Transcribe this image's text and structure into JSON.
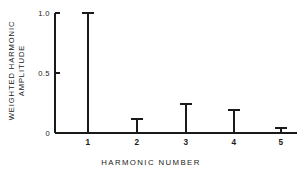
{
  "chart_data": {
    "type": "bar",
    "title": "",
    "xlabel": "HARMONIC NUMBER",
    "ylabel_lines": [
      "WEIGHTED  HARMONIC",
      "AMPLITUDE"
    ],
    "ylabel": "WEIGHTED HARMONIC AMPLITUDE",
    "categories": [
      "1",
      "2",
      "3",
      "4",
      "5"
    ],
    "values": [
      1.0,
      0.12,
      0.24,
      0.19,
      0.04
    ],
    "xtick_labels": [
      "1",
      "2",
      "3",
      "4",
      "5"
    ],
    "ytick_labels": [
      "0",
      "0.5",
      "1.0"
    ],
    "ytick_values": [
      0,
      0.5,
      1.0
    ],
    "ylim": [
      0,
      1.0
    ],
    "xlim": [
      0.5,
      5.5
    ],
    "grid": false,
    "legend": null,
    "marker_style": "flat-cap-stem",
    "line_color": "#1a1a1a",
    "background_color": "#ffffff"
  },
  "figure": {
    "axis_color": "#1a1a1a",
    "stem_color": "#1a1a1a"
  }
}
